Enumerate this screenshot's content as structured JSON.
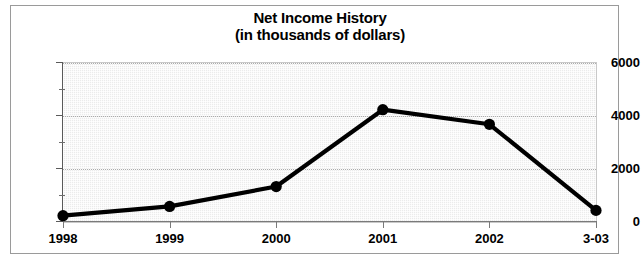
{
  "chart_data": {
    "type": "line",
    "title": "Net Income History",
    "subtitle": "(in thousands of dollars)",
    "xlabel": "",
    "ylabel": "",
    "categories": [
      "1998",
      "1999",
      "2000",
      "2001",
      "2002",
      "3-03"
    ],
    "values": [
      200,
      550,
      1300,
      4200,
      3650,
      400
    ],
    "series": [
      {
        "name": "Net Income",
        "values": [
          200,
          550,
          1300,
          4200,
          3650,
          400
        ]
      }
    ],
    "ylim": [
      0,
      6000
    ],
    "ytick_labels": [
      "0",
      "2000",
      "4000",
      "6000"
    ],
    "ytick_values": [
      0,
      2000,
      4000,
      6000
    ],
    "yminor_values": [
      1000,
      3000,
      5000
    ],
    "grid": "horizontal-dotted",
    "legend": "none",
    "marker": "filled-circle",
    "line_color": "#000000",
    "marker_color": "#000000",
    "plot_background": "#ebebeb",
    "figure_background": "#ffffff"
  },
  "chart": {
    "title_line1": "Net Income History",
    "title_line2": "(in thousands of dollars)"
  }
}
